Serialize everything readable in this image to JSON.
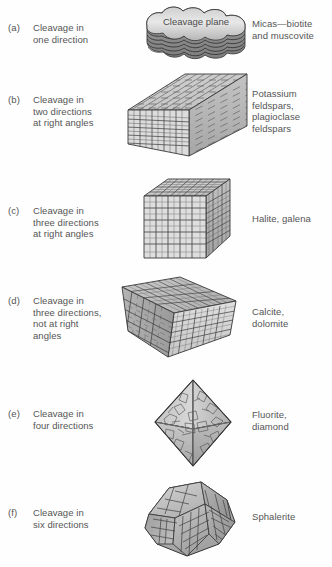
{
  "figure": {
    "rows": [
      {
        "letter": "(a)",
        "description": "Cleavage in one direction",
        "description_lines": [
          "Cleavage in",
          "one direction"
        ],
        "examples": "Micas—biotite and muscovite",
        "example_lines": [
          "Micas—biotite",
          "and muscovite"
        ],
        "art_name": "mica-book-cleavage-plane",
        "art_caption": "Cleavage plane"
      },
      {
        "letter": "(b)",
        "description": "Cleavage in two directions at right angles",
        "description_lines": [
          "Cleavage in",
          "two directions",
          "at right angles"
        ],
        "examples": "Potassium feldspars, plagioclase feldspars",
        "example_lines": [
          "Potassium",
          "feldspars,",
          "plagioclase",
          "feldspars"
        ],
        "art_name": "elongated-prism"
      },
      {
        "letter": "(c)",
        "description": "Cleavage in three directions at right angles",
        "description_lines": [
          "Cleavage in",
          "three directions",
          "at right angles"
        ],
        "examples": "Halite, galena",
        "example_lines": [
          "Halite, galena"
        ],
        "art_name": "cube"
      },
      {
        "letter": "(d)",
        "description": "Cleavage in three directions, not at right angles",
        "description_lines": [
          "Cleavage in",
          "three directions,",
          "not at right",
          "angles"
        ],
        "examples": "Calcite, dolomite",
        "example_lines": [
          "Calcite,",
          "dolomite"
        ],
        "art_name": "rhombohedron"
      },
      {
        "letter": "(e)",
        "description": "Cleavage in four directions",
        "description_lines": [
          "Cleavage in",
          "four directions"
        ],
        "examples": "Fluorite, diamond",
        "example_lines": [
          "Fluorite,",
          "diamond"
        ],
        "art_name": "octahedron"
      },
      {
        "letter": "(f)",
        "description": "Cleavage in six directions",
        "description_lines": [
          "Cleavage in",
          "six directions"
        ],
        "examples": "Sphalerite",
        "example_lines": [
          "Sphalerite"
        ],
        "art_name": "dodecahedron"
      }
    ],
    "colors": {
      "text": "#555555",
      "outline": "#3a3a3a",
      "fill_light": "#e2e2e2",
      "fill_mid": "#c9c9c9",
      "fill_dark": "#a8a8a8",
      "background": "#ffffff"
    }
  }
}
